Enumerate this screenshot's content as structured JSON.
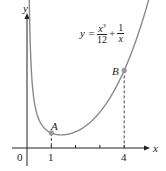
{
  "chart_data": {
    "type": "line",
    "title": "",
    "function_label": {
      "lhs": "y =",
      "term1_num": "x",
      "term1_exp": "3",
      "term1_den": "12",
      "plus": "+",
      "term2_num": "1",
      "term2_den": "x"
    },
    "xlabel": "x",
    "ylabel": "y",
    "x_ticks": [
      {
        "value": 0,
        "label": "0"
      },
      {
        "value": 1,
        "label": "1"
      },
      {
        "value": 2,
        "label": ""
      },
      {
        "value": 3,
        "label": ""
      },
      {
        "value": 4,
        "label": "4"
      }
    ],
    "series": [
      {
        "name": "y = x^3/12 + 1/x",
        "x_range": [
          0.07,
          5.3
        ],
        "values": "x^3/12 + 1/x"
      }
    ],
    "points": [
      {
        "label": "A",
        "x": 1,
        "y": 1.083
      },
      {
        "label": "B",
        "x": 4,
        "y": 5.333
      }
    ],
    "xlim": [
      -0.6,
      5.5
    ],
    "ylim": [
      -1.2,
      9.6
    ],
    "grid": false,
    "colors": {
      "curve": "#8a8a8a",
      "axis": "#222222",
      "point": "#9a9a9a"
    }
  }
}
